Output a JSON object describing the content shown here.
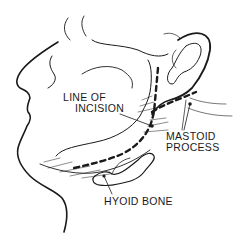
{
  "figure": {
    "labels": {
      "incision_line1": "LINE OF",
      "incision_line2": "INCISION",
      "mastoid_line1": "MASTOID",
      "mastoid_line2": "PROCESS",
      "hyoid": "HYOID BONE"
    },
    "colors": {
      "ink": "#1a1a1a",
      "background": "#ffffff"
    }
  }
}
